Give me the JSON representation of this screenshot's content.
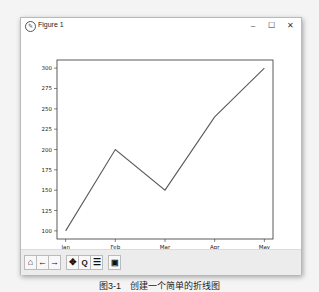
{
  "window": {
    "title": "Figure 1",
    "icon": "matplotlib-icon",
    "controls": {
      "minimize": "–",
      "maximize": "☐",
      "close": "✕"
    }
  },
  "toolbar": {
    "buttons": [
      {
        "name": "home",
        "glyph": "⌂"
      },
      {
        "name": "back",
        "glyph": "←"
      },
      {
        "name": "forward",
        "glyph": "→"
      },
      {
        "name": "pan",
        "glyph": "✥"
      },
      {
        "name": "zoom",
        "glyph": "🔍"
      },
      {
        "name": "configure-subplots",
        "glyph": "☰"
      },
      {
        "name": "save",
        "glyph": "💾"
      }
    ]
  },
  "caption": "图3-1　创建一个简单的折线图",
  "chart_data": {
    "type": "line",
    "title": "",
    "xlabel": "",
    "ylabel": "",
    "categories": [
      "Jan",
      "Feb",
      "Mar",
      "Apr",
      "May"
    ],
    "values": [
      100,
      200,
      150,
      240,
      300
    ],
    "yticks": [
      100,
      125,
      150,
      175,
      200,
      225,
      250,
      275,
      300
    ],
    "ylim": [
      90,
      310
    ],
    "grid": false,
    "legend": null,
    "line_color": "#5a5a5a"
  }
}
